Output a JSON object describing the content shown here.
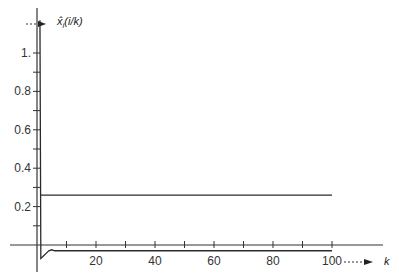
{
  "chart_data": {
    "type": "line",
    "title": "",
    "xlabel": "k",
    "ylabel": "x̂_i(i/k)",
    "xlim": [
      0,
      115
    ],
    "ylim": [
      -0.12,
      1.2
    ],
    "grid": false,
    "legend": null,
    "x_ticks": [
      0,
      10,
      20,
      30,
      40,
      50,
      60,
      70,
      80,
      90,
      100
    ],
    "x_tick_labels": [
      "",
      "",
      "20",
      "",
      "40",
      "",
      "60",
      "",
      "80",
      "",
      "100"
    ],
    "y_ticks": [
      0,
      0.1,
      0.2,
      0.3,
      0.4,
      0.5,
      0.6,
      0.7,
      0.8,
      0.9,
      1.0
    ],
    "y_tick_labels": [
      "",
      "",
      "0.2",
      "",
      "0.4",
      "",
      "0.6",
      "",
      "0.8",
      "",
      "1."
    ],
    "series": [
      {
        "name": "estimate",
        "x": [
          1,
          1.3,
          2,
          3,
          4,
          5,
          6,
          8,
          10,
          20,
          40,
          60,
          80,
          100
        ],
        "y": [
          1.17,
          -0.07,
          -0.06,
          -0.045,
          -0.03,
          -0.025,
          -0.03,
          -0.03,
          -0.03,
          -0.03,
          -0.03,
          -0.03,
          -0.03,
          -0.03
        ]
      },
      {
        "name": "reference level",
        "x": [
          1,
          100
        ],
        "y": [
          0.26,
          0.26
        ]
      }
    ]
  },
  "axes": {
    "y_label": "x̂",
    "y_label_sub": "i",
    "y_label_rest": "(i/k)",
    "x_label": "k"
  }
}
